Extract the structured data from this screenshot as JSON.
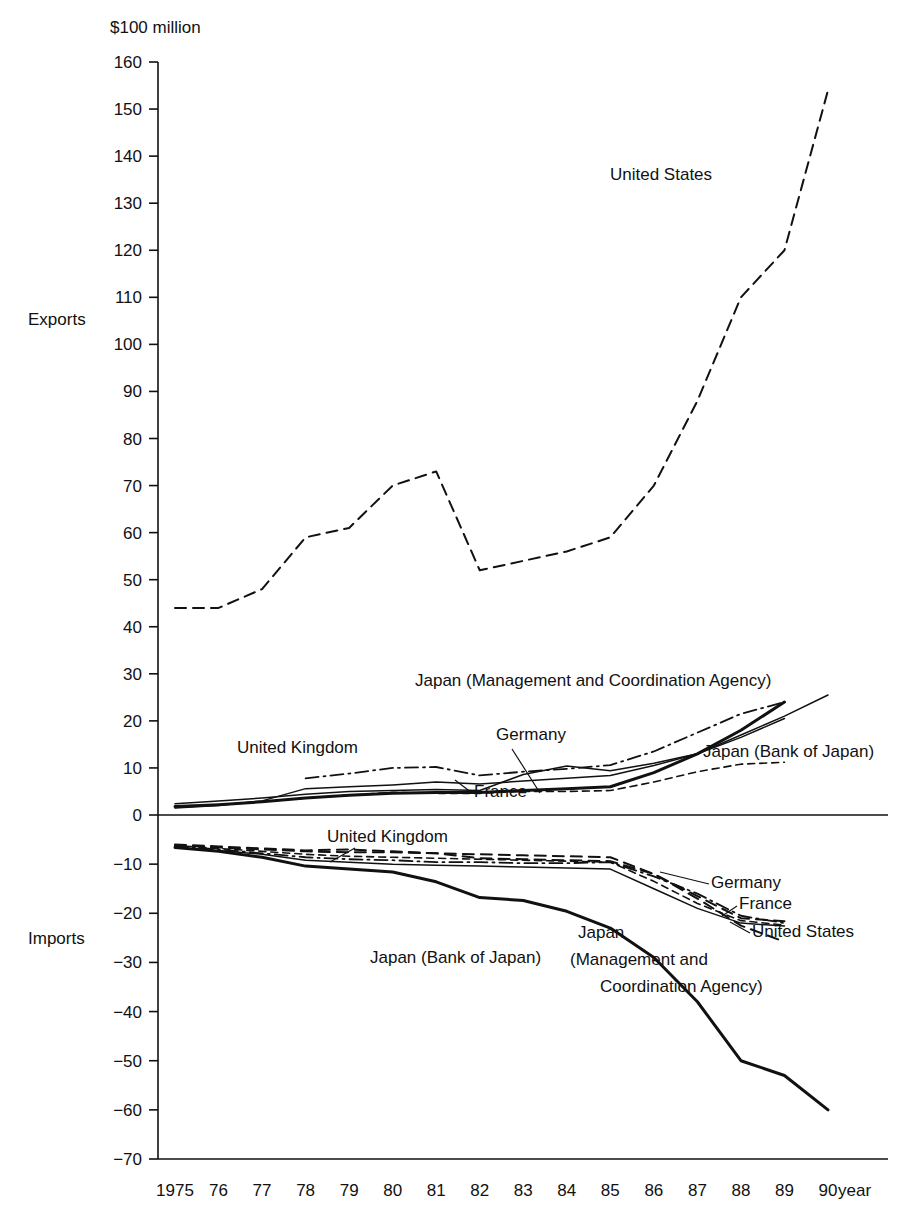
{
  "chart_data": {
    "type": "line",
    "title": "",
    "subtitle": "",
    "unit_label": "$100 million",
    "xlabel": "year",
    "ylabel": "",
    "section_labels": {
      "upper": "Exports",
      "lower": "Imports"
    },
    "x": [
      1975,
      1976,
      1977,
      1978,
      1979,
      1980,
      1981,
      1982,
      1983,
      1984,
      1985,
      1986,
      1987,
      1988,
      1989,
      1990
    ],
    "x_tick_labels": [
      "1975",
      "76",
      "77",
      "78",
      "79",
      "80",
      "81",
      "82",
      "83",
      "84",
      "85",
      "86",
      "87",
      "88",
      "89",
      "90"
    ],
    "y_tick_labels": [
      "160",
      "150",
      "140",
      "130",
      "120",
      "110",
      "100",
      "90",
      "80",
      "70",
      "60",
      "50",
      "40",
      "30",
      "20",
      "10",
      "0",
      "−10",
      "−20",
      "−30",
      "−40",
      "−50",
      "−60",
      "−70"
    ],
    "y_tick_values": [
      160,
      150,
      140,
      130,
      120,
      110,
      100,
      90,
      80,
      70,
      60,
      50,
      40,
      30,
      20,
      10,
      0,
      -10,
      -20,
      -30,
      -40,
      -50,
      -60,
      -70
    ],
    "ylim": [
      -70,
      160
    ],
    "xlim": [
      1975,
      1990
    ],
    "grid": false,
    "legend_position": "inline-annotations",
    "zero_line": 0,
    "series": [
      {
        "name": "United States",
        "group": "exports",
        "style": "dashed",
        "x": [
          1975,
          1976,
          1977,
          1978,
          1979,
          1980,
          1981,
          1982,
          1983,
          1984,
          1985,
          1986,
          1987,
          1988,
          1989,
          1990
        ],
        "values": [
          44,
          44,
          48,
          59,
          61,
          70,
          73,
          52,
          54,
          56,
          59,
          70,
          88,
          110,
          120,
          154
        ]
      },
      {
        "name": "Japan (Management and Coordination Agency)",
        "group": "exports",
        "style": "solid-thick",
        "x": [
          1975,
          1976,
          1977,
          1978,
          1979,
          1980,
          1981,
          1982,
          1983,
          1984,
          1985,
          1986,
          1987,
          1988,
          1989
        ],
        "values": [
          1.8,
          2.2,
          2.8,
          3.6,
          4.2,
          4.6,
          4.8,
          4.8,
          5.2,
          5.6,
          6.0,
          9.0,
          13.0,
          18.0,
          24.0
        ]
      },
      {
        "name": "Japan (Bank of Japan)",
        "group": "exports",
        "style": "solid-thin",
        "x": [
          1975,
          1976,
          1977,
          1978,
          1979,
          1980,
          1981,
          1982,
          1983,
          1984,
          1985,
          1986,
          1987,
          1988,
          1989,
          1990
        ],
        "values": [
          1.5,
          2.0,
          3.0,
          5.6,
          6.0,
          6.4,
          7.0,
          6.6,
          7.2,
          7.8,
          8.4,
          10.5,
          13.0,
          17.0,
          21.0,
          25.5
        ]
      },
      {
        "name": "United Kingdom",
        "group": "exports",
        "style": "dash-dot",
        "x": [
          1978,
          1979,
          1980,
          1981,
          1982,
          1983,
          1984,
          1985,
          1986,
          1987,
          1988,
          1989
        ],
        "values": [
          7.8,
          8.8,
          10.0,
          10.2,
          8.4,
          9.2,
          9.8,
          10.6,
          13.5,
          17.5,
          21.5,
          24.0
        ]
      },
      {
        "name": "Germany",
        "group": "exports",
        "style": "solid-thin",
        "x": [
          1975,
          1976,
          1977,
          1978,
          1979,
          1980,
          1981,
          1982,
          1983,
          1984,
          1985,
          1986,
          1987,
          1988,
          1989
        ],
        "values": [
          2.4,
          3.0,
          3.6,
          4.4,
          5.0,
          5.2,
          5.4,
          5.2,
          8.6,
          10.4,
          9.4,
          11.0,
          13.0,
          16.5,
          20.5
        ]
      },
      {
        "name": "France",
        "group": "exports",
        "style": "dashed-fine",
        "x": [
          1975,
          1976,
          1977,
          1978,
          1979,
          1980,
          1981,
          1982,
          1983,
          1984,
          1985,
          1986,
          1987,
          1988,
          1989
        ],
        "values": [
          1.6,
          2.2,
          2.8,
          3.6,
          4.2,
          4.8,
          4.6,
          4.6,
          5.0,
          5.0,
          5.2,
          7.0,
          9.2,
          10.8,
          11.2
        ]
      },
      {
        "name": "Japan (Bank of Japan)",
        "group": "imports",
        "style": "solid-thick",
        "x": [
          1975,
          1976,
          1977,
          1978,
          1979,
          1980,
          1981,
          1982,
          1983,
          1984,
          1985,
          1986,
          1987,
          1988,
          1989,
          1990
        ],
        "values": [
          -6.6,
          -7.4,
          -8.6,
          -10.4,
          -11.0,
          -11.6,
          -13.6,
          -16.8,
          -17.4,
          -19.6,
          -23.0,
          -29.0,
          -38.0,
          -50.0,
          -53.0,
          -60.0
        ]
      },
      {
        "name": "Japan (Management and Coordination Agency)",
        "group": "imports",
        "style": "solid-thin",
        "x": [
          1975,
          1976,
          1977,
          1978,
          1979,
          1980,
          1981,
          1982,
          1983,
          1984,
          1985,
          1986,
          1987,
          1988,
          1989
        ],
        "values": [
          -6.6,
          -7.2,
          -8.0,
          -9.2,
          -9.6,
          -10.0,
          -10.2,
          -10.4,
          -10.6,
          -10.8,
          -11.0,
          -15.0,
          -19.0,
          -22.0,
          -22.6
        ]
      },
      {
        "name": "United Kingdom",
        "group": "imports",
        "style": "dash-dot",
        "x": [
          1975,
          1976,
          1977,
          1978,
          1979,
          1980,
          1981,
          1982,
          1983,
          1984,
          1985,
          1986,
          1987,
          1988,
          1989
        ],
        "values": [
          -6.4,
          -7.0,
          -7.8,
          -8.6,
          -9.0,
          -9.2,
          -9.6,
          -9.6,
          -9.8,
          -9.8,
          -9.6,
          -12.5,
          -16.0,
          -20.5,
          -22.0
        ]
      },
      {
        "name": "Germany",
        "group": "imports",
        "style": "dashed",
        "x": [
          1975,
          1976,
          1977,
          1978,
          1979,
          1980,
          1981,
          1982,
          1983,
          1984,
          1985,
          1986,
          1987,
          1988,
          1989
        ],
        "values": [
          -6.0,
          -6.4,
          -6.8,
          -7.2,
          -7.0,
          -7.4,
          -7.8,
          -8.8,
          -9.0,
          -9.2,
          -9.4,
          -12.0,
          -16.5,
          -21.0,
          -21.6
        ]
      },
      {
        "name": "France",
        "group": "imports",
        "style": "dashed-fine",
        "x": [
          1975,
          1976,
          1977,
          1978,
          1979,
          1980,
          1981,
          1982,
          1983,
          1984,
          1985,
          1986,
          1987,
          1988,
          1989
        ],
        "values": [
          -6.2,
          -6.8,
          -7.4,
          -8.0,
          -8.4,
          -8.6,
          -8.8,
          -9.0,
          -9.2,
          -9.4,
          -9.6,
          -13.5,
          -18.0,
          -21.5,
          -22.4
        ]
      },
      {
        "name": "United States",
        "group": "imports",
        "style": "dashed",
        "x": [
          1975,
          1976,
          1977,
          1978,
          1979,
          1980,
          1981,
          1982,
          1983,
          1984,
          1985,
          1986,
          1987,
          1988,
          1989
        ],
        "values": [
          -6.2,
          -6.6,
          -7.0,
          -7.4,
          -7.6,
          -7.6,
          -7.8,
          -8.0,
          -8.2,
          -8.4,
          -8.6,
          -12.0,
          -17.0,
          -22.5,
          -25.8
        ]
      }
    ],
    "annotations": [
      {
        "id": "ann-us-exports",
        "text": "United States",
        "x_px": 610,
        "y_px": 180,
        "anchor": "start"
      },
      {
        "id": "ann-japan-mca-exports",
        "text": "Japan (Management and Coordination Agency)",
        "x_px": 415,
        "y_px": 686,
        "anchor": "start"
      },
      {
        "id": "ann-uk-exports",
        "text": "United Kingdom",
        "x_px": 237,
        "y_px": 753,
        "anchor": "start"
      },
      {
        "id": "ann-germany-exports",
        "text": "Germany",
        "x_px": 496,
        "y_px": 740,
        "anchor": "start"
      },
      {
        "id": "ann-boj-exports",
        "text": "Japan (Bank of Japan)",
        "x_px": 703,
        "y_px": 757,
        "anchor": "start"
      },
      {
        "id": "ann-france-exports",
        "text": "France",
        "x_px": 474,
        "y_px": 797,
        "anchor": "start"
      },
      {
        "id": "ann-uk-imports",
        "text": "United Kingdom",
        "x_px": 327,
        "y_px": 842,
        "anchor": "start"
      },
      {
        "id": "ann-germany-imports",
        "text": "Germany",
        "x_px": 711,
        "y_px": 888,
        "anchor": "start"
      },
      {
        "id": "ann-france-imports",
        "text": "France",
        "x_px": 739,
        "y_px": 909,
        "anchor": "start"
      },
      {
        "id": "ann-us-imports",
        "text": "United States",
        "x_px": 752,
        "y_px": 937,
        "anchor": "start"
      },
      {
        "id": "ann-boj-imports",
        "text": "Japan (Bank of Japan)",
        "x_px": 370,
        "y_px": 963,
        "anchor": "start"
      },
      {
        "id": "ann-japan-mca-imports-1",
        "text": "Japan",
        "x_px": 578,
        "y_px": 938,
        "anchor": "start"
      },
      {
        "id": "ann-japan-mca-imports-2",
        "text": "(Management and",
        "x_px": 570,
        "y_px": 965,
        "anchor": "start"
      },
      {
        "id": "ann-japan-mca-imports-3",
        "text": "Coordination Agency)",
        "x_px": 600,
        "y_px": 992,
        "anchor": "start"
      }
    ],
    "leader_lines": [
      {
        "id": "leader-germany-exports",
        "x1": 512,
        "y1": 749,
        "x2": 540,
        "y2": 793
      },
      {
        "id": "leader-france-exports",
        "x1": 472,
        "y1": 793,
        "x2": 455,
        "y2": 780
      },
      {
        "id": "leader-uk-imports",
        "x1": 355,
        "y1": 848,
        "x2": 330,
        "y2": 862
      },
      {
        "id": "leader-germany-imports",
        "x1": 709,
        "y1": 884,
        "x2": 660,
        "y2": 872
      },
      {
        "id": "leader-france-imports",
        "x1": 737,
        "y1": 906,
        "x2": 722,
        "y2": 916
      },
      {
        "id": "leader-us-imports",
        "x1": 750,
        "y1": 933,
        "x2": 730,
        "y2": 922
      }
    ]
  }
}
